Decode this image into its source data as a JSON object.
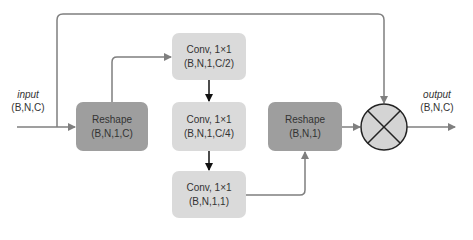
{
  "input": {
    "name": "input",
    "shape": "(B,N,C)"
  },
  "output": {
    "name": "output",
    "shape": "(B,N,C)"
  },
  "nodes": {
    "reshape_in": {
      "title": "Reshape",
      "shape": "(B,N,1,C)"
    },
    "conv1": {
      "title": "Conv, 1×1",
      "shape": "(B,N,1,C/2)"
    },
    "conv2": {
      "title": "Conv, 1×1",
      "shape": "(B,N,1,C/4)"
    },
    "conv3": {
      "title": "Conv, 1×1",
      "shape": "(B,N,1,1)"
    },
    "reshape_out": {
      "title": "Reshape",
      "shape": "(B,N,1)"
    },
    "multiply": {
      "symbol": "⊗"
    }
  },
  "colors": {
    "dark_box": "#9e9e9e",
    "light_box": "#dadada",
    "line": "#7f7f7f",
    "arrow_black": "#111111",
    "circle_fill": "#d4d4d4"
  }
}
